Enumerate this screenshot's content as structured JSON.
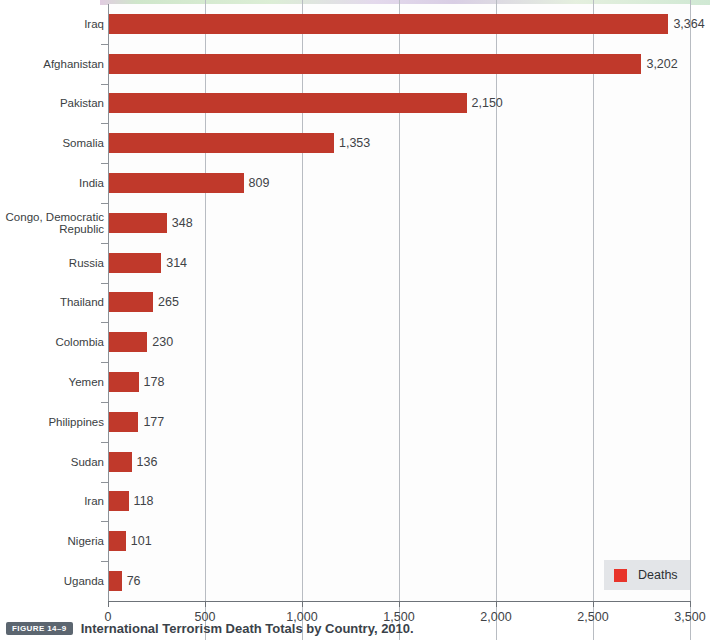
{
  "chart_data": {
    "type": "bar",
    "orientation": "horizontal",
    "title": "International Terrorism Death Totals by Country, 2010.",
    "xlabel": "",
    "ylabel": "",
    "xlim": [
      0,
      3500
    ],
    "grid": true,
    "legend_position": "bottom-right",
    "categories": [
      "Iraq",
      "Afghanistan",
      "Pakistan",
      "Somalia",
      "India",
      "Congo, Democratic Republic",
      "Russia",
      "Thailand",
      "Colombia",
      "Yemen",
      "Philippines",
      "Sudan",
      "Iran",
      "Nigeria",
      "Uganda"
    ],
    "values": [
      3364,
      3202,
      2150,
      1353,
      809,
      348,
      314,
      265,
      230,
      178,
      177,
      136,
      118,
      101,
      76
    ],
    "value_labels": [
      "3,364",
      "3,202",
      "2,150",
      "1,353",
      "809",
      "348",
      "314",
      "265",
      "230",
      "178",
      "177",
      "136",
      "118",
      "101",
      "76"
    ],
    "series": [
      {
        "name": "Deaths",
        "color": "#c0392b",
        "values": [
          3364,
          3202,
          2150,
          1353,
          809,
          348,
          314,
          265,
          230,
          178,
          177,
          136,
          118,
          101,
          76
        ]
      }
    ],
    "xticks": [
      0,
      500,
      1000,
      1500,
      2000,
      2500,
      3000
    ],
    "xticklabels": [
      "0",
      "500",
      "1,000",
      "1,500",
      "2,000",
      "2,500",
      "3,500"
    ]
  },
  "legend": {
    "items": [
      {
        "label": "Deaths",
        "color": "#e8342a"
      }
    ]
  },
  "caption": {
    "figure_badge": "FIGURE 14–9",
    "text": "International Terrorism Death Totals by Country, 2010."
  },
  "colors": {
    "bar": "#c0392b",
    "legend_swatch": "#e8342a",
    "gridline": "#b8bcc2",
    "axis": "#6d7278",
    "badge_background": "#5c6670",
    "caption_text": "#3a4249"
  }
}
